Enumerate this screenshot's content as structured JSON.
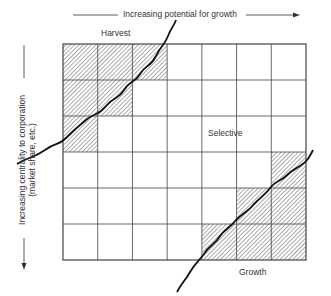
{
  "top_axis": {
    "label": "Increasing potential for growth"
  },
  "side_axis": {
    "label_line1": "Increasing centrality to corporation",
    "label_line2": "(market share, etc.)"
  },
  "regions": {
    "harvest": "Harvest",
    "selective": "Selective",
    "growth": "Growth"
  },
  "grid": {
    "columns": 7,
    "rows": 6,
    "shaded_cells": [
      [
        0,
        0
      ],
      [
        0,
        1
      ],
      [
        0,
        2
      ],
      [
        1,
        0
      ],
      [
        1,
        1
      ],
      [
        2,
        0
      ],
      [
        3,
        6
      ],
      [
        4,
        5
      ],
      [
        4,
        6
      ],
      [
        5,
        4
      ],
      [
        5,
        5
      ],
      [
        5,
        6
      ]
    ]
  }
}
